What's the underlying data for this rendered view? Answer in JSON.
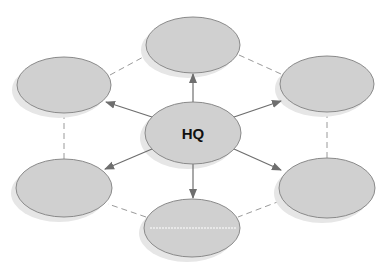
{
  "diagram": {
    "center": {
      "label": "HQ",
      "cx": 193,
      "cy": 133,
      "rx": 48,
      "ry": 31
    },
    "nodes": [
      {
        "id": "top",
        "label": "",
        "cx": 193,
        "cy": 45,
        "rx": 47,
        "ry": 28
      },
      {
        "id": "top-right",
        "label": "",
        "cx": 327,
        "cy": 84,
        "rx": 47,
        "ry": 28
      },
      {
        "id": "bottom-right",
        "label": "",
        "cx": 327,
        "cy": 188,
        "rx": 48,
        "ry": 30
      },
      {
        "id": "bottom",
        "label": "",
        "cx": 192,
        "cy": 228,
        "rx": 48,
        "ry": 29
      },
      {
        "id": "bottom-left",
        "label": "",
        "cx": 64,
        "cy": 188,
        "rx": 48,
        "ry": 29
      },
      {
        "id": "top-left",
        "label": "",
        "cx": 64,
        "cy": 85,
        "rx": 47,
        "ry": 28
      }
    ],
    "colors": {
      "fill": "#d0d0d0",
      "stroke": "#8a8a8a",
      "shadow": "#e4e4e4",
      "arrow": "#6e6e6e",
      "dash": "#9a9a9a"
    }
  }
}
